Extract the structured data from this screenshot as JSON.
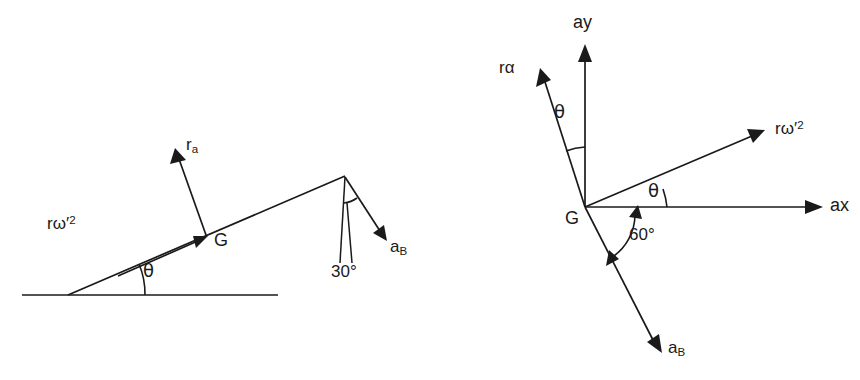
{
  "figure": {
    "background_color": "#ffffff",
    "ink_color": "#1a1a1a",
    "width": 860,
    "height": 380
  },
  "left_diagram": {
    "name": "inclined-plane-diagram",
    "description": "Rod on an inclined plane showing centripetal and tangential acceleration at G and acceleration of B at the top end",
    "labels": {
      "r_omega_sq": "rω′",
      "r_omega_sq_exp": "2",
      "r_a": "r",
      "r_a_sub": "a",
      "center_of_mass": "G",
      "incline_angle": "θ",
      "top_angle": "30°",
      "a_B": "a",
      "a_B_sub": "B"
    },
    "geometry": {
      "ground_line": {
        "x1": 22,
        "y1": 295,
        "x2": 278,
        "y2": 295
      },
      "incline_base": {
        "x": 68,
        "y": 295
      },
      "incline_apex": {
        "x": 343,
        "y": 175
      },
      "incline_angle_deg": 23.6,
      "G_point": {
        "x": 207,
        "y": 236
      },
      "r_omega_vector": {
        "from_x": 120,
        "from_y": 274,
        "to_x": 203,
        "to_y": 238
      },
      "r_a_vector": {
        "from_x": 205,
        "from_y": 234,
        "to_x": 177,
        "to_y": 154
      },
      "vertical_reference": {
        "x1": 345,
        "y1": 177,
        "x2": 340,
        "y2": 262
      },
      "angle_leader": {
        "x1": 347,
        "y1": 200,
        "x2": 352,
        "y2": 262
      },
      "a_B_vector": {
        "from_x": 345,
        "from_y": 177,
        "to_x": 384,
        "to_y": 237
      },
      "a_B_angle_from_vertical_deg": 30
    }
  },
  "right_diagram": {
    "name": "acceleration-vector-polygon",
    "description": "Vector diagram at G with ax and ay axes, r-alpha, r-omega-prime-squared and a_B vectors",
    "labels": {
      "axis_y": "ay",
      "axis_x": "ax",
      "origin": "G",
      "r_alpha": "rα",
      "r_omega_sq": "rω′",
      "r_omega_sq_exp": "2",
      "theta_upper": "θ",
      "theta_lower": "θ",
      "angle_60": "60°",
      "a_B": "a",
      "a_B_sub": "B"
    },
    "geometry": {
      "origin": {
        "x": 585,
        "y": 207
      },
      "ay_axis": {
        "to_x": 585,
        "to_y": 48
      },
      "ax_axis": {
        "to_x": 820,
        "to_y": 207
      },
      "r_alpha_vector": {
        "to_x": 537,
        "to_y": 72,
        "angle_from_ay_deg": 17
      },
      "r_omega_vector": {
        "to_x": 762,
        "to_y": 130,
        "angle_from_ax_deg": 17
      },
      "a_B_vector": {
        "to_x": 660,
        "to_y": 350,
        "angle_from_ax_deg": 60
      },
      "theta_upper_arc_radius": 58,
      "theta_lower_arc_radius": 82,
      "angle_60_arc_radius": 52
    }
  }
}
